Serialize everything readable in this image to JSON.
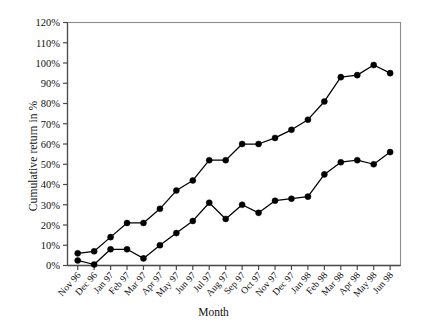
{
  "chart_data": {
    "type": "line",
    "title": "",
    "xlabel": "Month",
    "ylabel": "Cumulative return in %",
    "categories": [
      "Nov 96",
      "Dec 96",
      "Jan 97",
      "Feb 97",
      "Mar 97",
      "Apr 97",
      "May 97",
      "Jun 97",
      "Jul 97",
      "Aug 97",
      "Sep 97",
      "Oct 97",
      "Nov 97",
      "Dec 97",
      "Jan 98",
      "Feb 98",
      "Mar 98",
      "Apr 98",
      "May 98",
      "Jun 98"
    ],
    "ytick_labels": [
      "0%",
      "10%",
      "20%",
      "30%",
      "40%",
      "50%",
      "60%",
      "70%",
      "80%",
      "90%",
      "100%",
      "110%",
      "120%"
    ],
    "ytick_values": [
      0,
      10,
      20,
      30,
      40,
      50,
      60,
      70,
      80,
      90,
      100,
      110,
      120
    ],
    "ylim": [
      0,
      120
    ],
    "grid": false,
    "legend": "none",
    "marker": "filled-circle",
    "line_color": "#000000",
    "series": [
      {
        "name": "upper-series",
        "values": [
          6,
          7,
          14,
          21,
          21,
          28,
          37,
          42,
          52,
          52,
          60,
          60,
          63,
          67,
          72,
          81,
          93,
          94,
          99,
          95
        ]
      },
      {
        "name": "lower-series",
        "values": [
          2.5,
          0.5,
          8,
          8,
          3.5,
          10,
          16,
          22,
          31,
          23,
          30,
          26,
          32,
          33,
          34,
          45,
          51,
          52,
          50,
          56
        ]
      }
    ]
  },
  "axes": {
    "y_axis_title": "Cumulative return in %",
    "x_axis_title": "Month"
  }
}
